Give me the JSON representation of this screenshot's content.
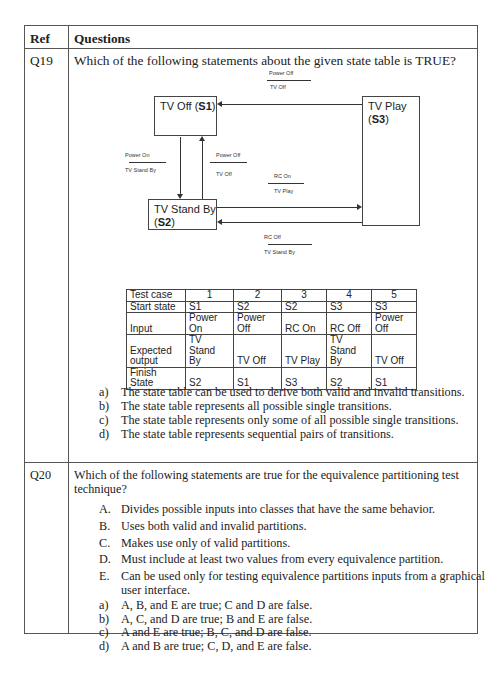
{
  "header": {
    "ref": "Ref",
    "questions": "Questions"
  },
  "q19": {
    "ref": "Q19",
    "question": "Which of the following statements about the given state table is TRUE?",
    "diagram": {
      "states": {
        "s1": {
          "name": "TV Off (",
          "id": "S1",
          "close": ")"
        },
        "s2": {
          "name": "TV Stand By",
          "id": "S2"
        },
        "s3": {
          "name": "TV Play",
          "id": "S3"
        }
      },
      "transitions": {
        "s3_s1": {
          "event": "Power Off",
          "action": "TV Off"
        },
        "s1_s2": {
          "event": "Power On",
          "action": "TV Stand By"
        },
        "s2_s1": {
          "event": "Power Off",
          "action": "TV Off"
        },
        "s2_s3": {
          "event": "RC On",
          "action": "TV Play"
        },
        "s3_s2": {
          "event": "RC Off",
          "action": "TV Stand By"
        }
      }
    },
    "table": {
      "row_labels": [
        "Test case",
        "Start state",
        "Input",
        "Expected output",
        "Finish State"
      ],
      "test_cases": [
        "1",
        "2",
        "3",
        "4",
        "5"
      ],
      "start_state": [
        "S1",
        "S2",
        "S2",
        "S3",
        "S3"
      ],
      "input": [
        "Power On",
        "Power Off",
        "RC On",
        "RC Off",
        "Power Off"
      ],
      "expected_output": [
        "TV Stand By",
        "TV Off",
        "TV Play",
        "TV Stand By",
        "TV Off"
      ],
      "finish_state": [
        "S2",
        "S1",
        "S3",
        "S2",
        "S1"
      ]
    },
    "options": [
      {
        "label": "a)",
        "text": "The state table can be used to derive both valid and invalid transitions."
      },
      {
        "label": "b)",
        "text": "The state table represents all possible single transitions."
      },
      {
        "label": "c)",
        "text": "The state table represents only some of all possible single transitions."
      },
      {
        "label": "d)",
        "text": "The state table represents sequential pairs of transitions."
      }
    ]
  },
  "q20": {
    "ref": "Q20",
    "question_line1": "Which of the following statements are true for the equivalence partitioning test",
    "question_line2": "technique?",
    "statements": [
      {
        "label": "A.",
        "text": "Divides possible inputs into classes that have the same behavior."
      },
      {
        "label": "B.",
        "text": "Uses both valid and invalid partitions."
      },
      {
        "label": "C.",
        "text": "Makes use only of valid partitions."
      },
      {
        "label": "D.",
        "text": "Must include at least two values from every equivalence partition."
      },
      {
        "label": "E.",
        "text": "Can be used only for testing equivalence partitions inputs from a graphical",
        "text2": "user interface."
      }
    ],
    "options": [
      {
        "label": "a)",
        "text": "A, B, and E are true; C and D are false."
      },
      {
        "label": "b)",
        "text": "A, C, and D are true; B and E are false."
      },
      {
        "label": "c)",
        "text": "A and E are true; B, C, and D are false."
      },
      {
        "label": "d)",
        "text": "A and B are true; C, D, and E are false."
      }
    ]
  }
}
